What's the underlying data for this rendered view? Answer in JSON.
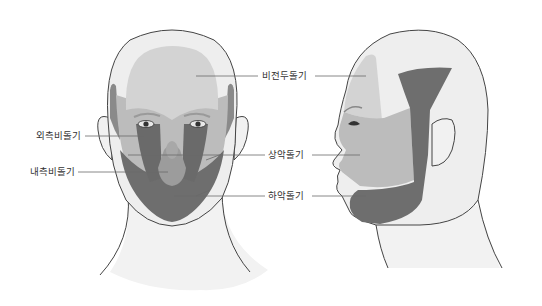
{
  "labels": {
    "frontonasal": "비전두돌기",
    "lateral_nasal": "외측비돌기",
    "medial_nasal": "내측비돌기",
    "maxillary": "상악돌기",
    "mandibular": "하악돌기"
  },
  "colors": {
    "skin": "#efefef",
    "frontonasal_region": "#d3d3d3",
    "maxillary_region": "#b9b9b9",
    "lateral_nasal_region": "#707070",
    "medial_nasal_region": "#9a9a9a",
    "mandibular_region": "#6e6e6e",
    "temple_side": "#8f8f8f",
    "outline": "#444444",
    "text": "#333333"
  },
  "views": [
    "front",
    "side"
  ]
}
